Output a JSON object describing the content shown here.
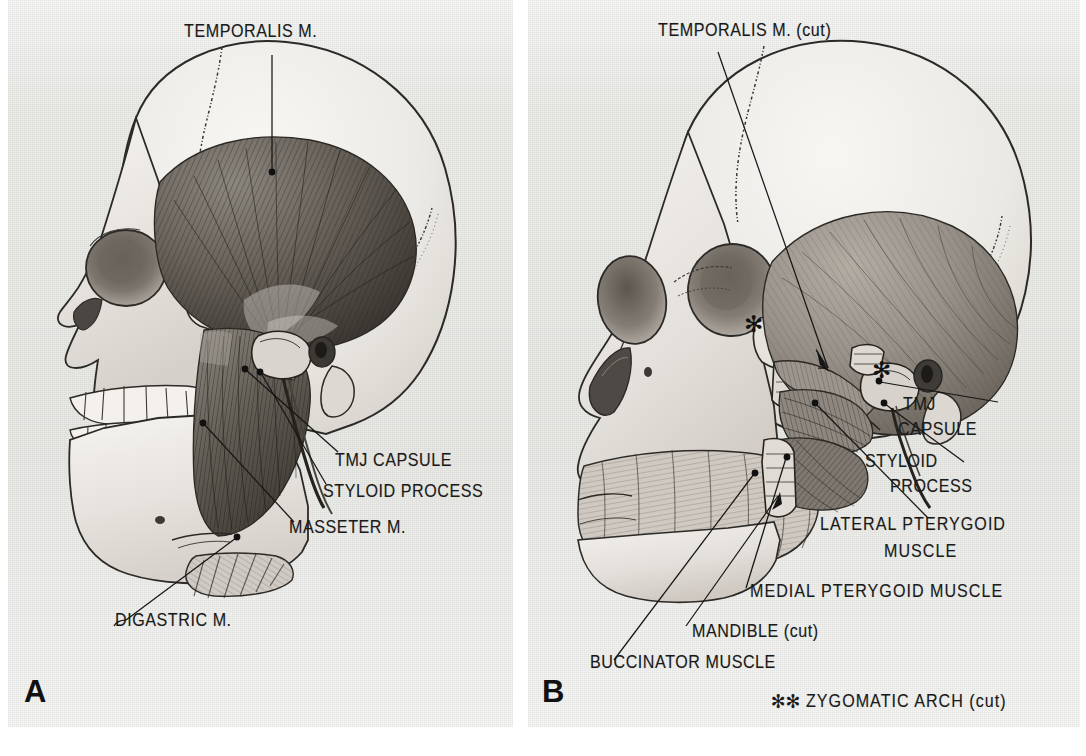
{
  "figure": {
    "background_color": "#ededea",
    "page_color": "#ffffff",
    "ink_color": "#1a1a1a"
  },
  "panelA": {
    "letter": "A",
    "labels": {
      "temporalis": "TEMPORALIS M.",
      "tmj_capsule": "TMJ CAPSULE",
      "styloid_process": "STYLOID PROCESS",
      "masseter": "MASSETER M.",
      "digastric": "DIGASTRIC M."
    }
  },
  "panelB": {
    "letter": "B",
    "labels": {
      "temporalis_cut": "TEMPORALIS M. (cut)",
      "tmj": "TMJ",
      "capsule": "CAPSULE",
      "styloid": "STYLOID",
      "process": "PROCESS",
      "lateral_pterygoid": "LATERAL  PTERYGOID",
      "lateral_pterygoid_2": "MUSCLE",
      "medial_pterygoid": "MEDIAL  PTERYGOID  MUSCLE",
      "mandible_cut": "MANDIBLE (cut)",
      "buccinator": "BUCCINATOR MUSCLE",
      "zygomatic_stars": "✻✻",
      "zygomatic_arch_cut": "ZYGOMATIC  ARCH (cut)"
    },
    "markers": {
      "asterisk_maxilla": "✻",
      "asterisk_tmj": "✻"
    }
  }
}
